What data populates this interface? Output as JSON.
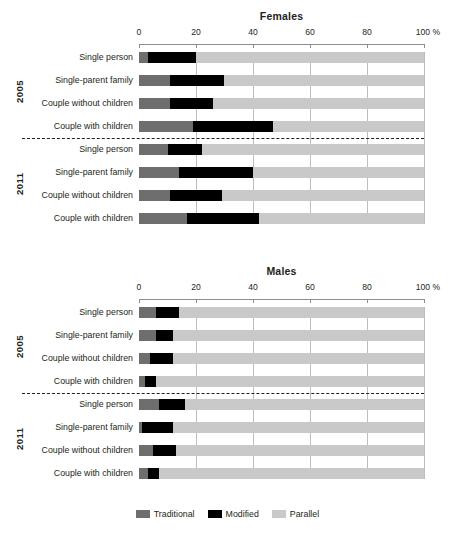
{
  "chart_data": [
    {
      "type": "bar",
      "title": "Females",
      "orientation": "horizontal",
      "stacked": true,
      "stacked_total": 100,
      "xlabel": "",
      "ylabel": "",
      "xlim": [
        0,
        100
      ],
      "unit": "%",
      "grid": true,
      "legend_position": "bottom",
      "tick_labels": [
        "0",
        "20",
        "40",
        "60",
        "80",
        "100 %"
      ],
      "tick_values": [
        0,
        20,
        40,
        60,
        80,
        100
      ],
      "groups": [
        {
          "label": "2005",
          "categories": [
            "Single person",
            "Single-parent family",
            "Couple without children",
            "Couple with children"
          ],
          "series": [
            {
              "name": "Traditional",
              "values": [
                3,
                11,
                11,
                19
              ]
            },
            {
              "name": "Modified",
              "values": [
                17,
                19,
                15,
                28
              ]
            },
            {
              "name": "Parallel",
              "values": [
                80,
                70,
                74,
                53
              ]
            }
          ]
        },
        {
          "label": "2011",
          "categories": [
            "Single person",
            "Single-parent family",
            "Couple without children",
            "Couple with children"
          ],
          "series": [
            {
              "name": "Traditional",
              "values": [
                10,
                14,
                11,
                17
              ]
            },
            {
              "name": "Modified",
              "values": [
                12,
                26,
                18,
                25
              ]
            },
            {
              "name": "Parallel",
              "values": [
                78,
                60,
                71,
                58
              ]
            }
          ]
        }
      ]
    },
    {
      "type": "bar",
      "title": "Males",
      "orientation": "horizontal",
      "stacked": true,
      "stacked_total": 100,
      "xlabel": "",
      "ylabel": "",
      "xlim": [
        0,
        100
      ],
      "unit": "%",
      "grid": true,
      "legend_position": "bottom",
      "tick_labels": [
        "0",
        "20",
        "40",
        "60",
        "80",
        "100 %"
      ],
      "tick_values": [
        0,
        20,
        40,
        60,
        80,
        100
      ],
      "groups": [
        {
          "label": "2005",
          "categories": [
            "Single person",
            "Single-parent family",
            "Couple without children",
            "Couple with children"
          ],
          "series": [
            {
              "name": "Traditional",
              "values": [
                6,
                6,
                4,
                2
              ]
            },
            {
              "name": "Modified",
              "values": [
                8,
                6,
                8,
                4
              ]
            },
            {
              "name": "Parallel",
              "values": [
                86,
                88,
                88,
                94
              ]
            }
          ]
        },
        {
          "label": "2011",
          "categories": [
            "Single person",
            "Single-parent family",
            "Couple without children",
            "Couple with children"
          ],
          "series": [
            {
              "name": "Traditional",
              "values": [
                7,
                1,
                5,
                3
              ]
            },
            {
              "name": "Modified",
              "values": [
                9,
                11,
                8,
                4
              ]
            },
            {
              "name": "Parallel",
              "values": [
                84,
                88,
                87,
                93
              ]
            }
          ]
        }
      ]
    }
  ],
  "legend": {
    "items": [
      {
        "label": "Traditional",
        "color": "#6e6e6e"
      },
      {
        "label": "Modified",
        "color": "#000000"
      },
      {
        "label": "Parallel",
        "color": "#c9c9c9"
      }
    ]
  },
  "colors": {
    "traditional": "#6e6e6e",
    "modified": "#000000",
    "parallel": "#c9c9c9",
    "gridline": "#bdbdbd",
    "axis": "#8c8c8c",
    "text": "#231f20"
  }
}
